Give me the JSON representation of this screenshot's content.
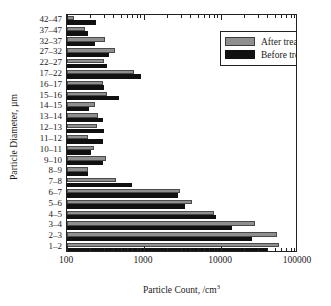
{
  "chart_data": {
    "type": "bar",
    "orientation": "horizontal",
    "title": "",
    "xlabel": "Particle Count, /cm",
    "xlabel_sup": "3",
    "ylabel": "Particle Diameter, µm",
    "xscale": "log",
    "xlim": [
      100,
      100000
    ],
    "xticks": [
      100,
      1000,
      10000,
      100000
    ],
    "xticklabels": [
      "100",
      "1000",
      "10000",
      "100000"
    ],
    "grid": false,
    "legend_position": "top-right",
    "categories": [
      "42–47",
      "37–47",
      "32–37",
      "27–32",
      "22–27",
      "17–22",
      "16–17",
      "15–16",
      "14–15",
      "13–14",
      "12–13",
      "11–12",
      "10–11",
      "9–10",
      "8–9",
      "7–8",
      "6–7",
      "5–6",
      "4–5",
      "3–4",
      "2–3",
      "1–2"
    ],
    "series": [
      {
        "name": "After treatment",
        "color": "#8f8f8f",
        "values": [
          124,
          170,
          310,
          420,
          300,
          740,
          290,
          330,
          230,
          255,
          245,
          185,
          225,
          320,
          185,
          430,
          2950,
          4200,
          8200,
          28000,
          54000,
          56000
        ]
      },
      {
        "name": "Before treatment",
        "color": "#111111",
        "values": [
          240,
          185,
          230,
          350,
          330,
          910,
          300,
          480,
          195,
          290,
          305,
          290,
          205,
          290,
          190,
          690,
          2750,
          3400,
          8700,
          14000,
          25000,
          41000
        ]
      }
    ]
  },
  "legend": {
    "items": [
      {
        "label": "After treatment",
        "key": "after"
      },
      {
        "label": "Before treatment",
        "key": "before"
      }
    ]
  },
  "colors": {
    "after": "#8f8f8f",
    "before": "#111111",
    "axis": "#222222",
    "background": "#ffffff"
  }
}
